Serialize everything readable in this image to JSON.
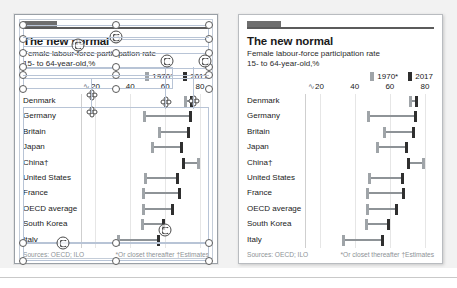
{
  "document": {
    "title": "The new normal",
    "subtitle_line1": "Female labour-force participation rate",
    "subtitle_line2": "15- to 64-year-old,%"
  },
  "legend": {
    "items": [
      {
        "label": "1970*",
        "color": "#9fa4a8",
        "key": "v1970"
      },
      {
        "label": "2017",
        "color": "#2f2f2f",
        "key": "v2017"
      }
    ]
  },
  "footer": {
    "sources": "Sources: OECD; ILO",
    "note_star": "*Or closet thereafter",
    "note_dagger": "†Estimates"
  },
  "axis": {
    "break_glyph": "∿",
    "ticks": [
      20,
      40,
      60,
      80
    ],
    "tick_labels": [
      "20",
      "40",
      "60",
      "80"
    ],
    "min": 14,
    "max": 84
  },
  "editor": {
    "panel_left_name": "design-canvas",
    "panel_right_name": "preview-canvas"
  },
  "chart_data": {
    "type": "bar",
    "subtype": "dumbbell-range",
    "title": "The new normal",
    "subtitle": "Female labour-force participation rate, 15- to 64-year-old, %",
    "xlabel": "",
    "ylabel": "",
    "xlim": [
      14,
      84
    ],
    "grid": true,
    "legend_position": "top-right",
    "categories": [
      "Denmark",
      "Germany",
      "Britain",
      "Japan",
      "China†",
      "United States",
      "France",
      "OECD average",
      "South Korea",
      "Italy"
    ],
    "series": [
      {
        "name": "1970*",
        "color": "#9fa4a8",
        "values": [
          71.5,
          48.0,
          57.0,
          53.0,
          79.0,
          48.5,
          47.5,
          47.5,
          47.0,
          33.5
        ]
      },
      {
        "name": "2017",
        "color": "#2f2f2f",
        "values": [
          75.0,
          74.5,
          73.5,
          69.5,
          70.5,
          67.0,
          68.0,
          64.0,
          59.0,
          56.0
        ]
      }
    ],
    "rows": [
      {
        "country": "Denmark",
        "v1970": 71.5,
        "v2017": 75.0
      },
      {
        "country": "Germany",
        "v1970": 48.0,
        "v2017": 74.5
      },
      {
        "country": "Britain",
        "v1970": 57.0,
        "v2017": 73.5
      },
      {
        "country": "Japan",
        "v1970": 53.0,
        "v2017": 69.5
      },
      {
        "country": "China†",
        "v1970": 79.0,
        "v2017": 70.5
      },
      {
        "country": "United States",
        "v1970": 48.5,
        "v2017": 67.0
      },
      {
        "country": "France",
        "v1970": 47.5,
        "v2017": 68.0
      },
      {
        "country": "OECD average",
        "v1970": 47.5,
        "v2017": 64.0
      },
      {
        "country": "South Korea",
        "v1970": 47.0,
        "v2017": 59.0
      },
      {
        "country": "Italy",
        "v1970": 33.5,
        "v2017": 56.0
      }
    ]
  }
}
